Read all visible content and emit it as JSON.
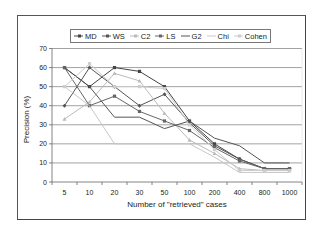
{
  "chart_data": {
    "type": "line",
    "title": "",
    "xlabel": "Number of \"retrieved\" cases",
    "ylabel": "Precision (%)",
    "categories": [
      "5",
      "10",
      "20",
      "30",
      "50",
      "100",
      "200",
      "400",
      "800",
      "1000"
    ],
    "yticks": [
      "0",
      "10",
      "20",
      "30",
      "40",
      "50",
      "60",
      "70"
    ],
    "ylim": [
      0,
      70
    ],
    "grid": true,
    "legend_position": "top",
    "series": [
      {
        "name": "MD",
        "color": "#444444",
        "marker": "square",
        "values": [
          60,
          50,
          60,
          58,
          50,
          32,
          20,
          12,
          7,
          7
        ]
      },
      {
        "name": "WS",
        "color": "#555555",
        "marker": "diamond",
        "values": [
          40,
          60,
          50,
          40,
          46,
          31,
          19,
          12,
          7,
          7
        ]
      },
      {
        "name": "C2",
        "color": "#bbbbbb",
        "marker": "triangle",
        "values": [
          33,
          42,
          57,
          53,
          36,
          22,
          15,
          7,
          6,
          6
        ]
      },
      {
        "name": "LS",
        "color": "#666666",
        "marker": "square",
        "values": [
          60,
          40,
          45,
          37,
          32,
          27,
          18,
          11,
          7,
          7
        ]
      },
      {
        "name": "G2",
        "color": "#555555",
        "marker": "none",
        "values": [
          60,
          50,
          34,
          34,
          28,
          32,
          23,
          19,
          10,
          10
        ]
      },
      {
        "name": "Chi",
        "color": "#c8c8c8",
        "marker": "none",
        "values": [
          50,
          40,
          20,
          20,
          20,
          20,
          13,
          5,
          5,
          5
        ]
      },
      {
        "name": "Cohen",
        "color": "#cccccc",
        "marker": "square",
        "values": [
          50,
          62,
          50,
          50,
          49,
          30,
          17,
          6,
          6,
          6
        ]
      }
    ]
  }
}
